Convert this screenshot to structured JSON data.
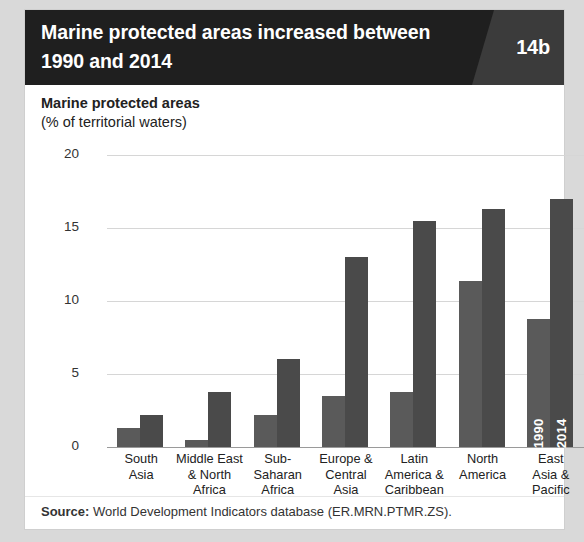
{
  "header": {
    "title": "Marine protected areas increased between 1990 and 2014",
    "badge": "14b"
  },
  "axis_title": {
    "main": "Marine protected areas",
    "sub": "(% of territorial waters)"
  },
  "source": {
    "label": "Source:",
    "text": " World Development Indicators database (ER.MRN.PTMR.ZS)."
  },
  "colors": {
    "header_bg": "#1f1f1f",
    "badge_bg": "#3b3b3b",
    "bar_1990": "#5a5a5a",
    "bar_2014": "#4a4a4a",
    "gridline": "#d6d6d6",
    "page_bg": "#d9d9d9"
  },
  "chart_data": {
    "type": "bar",
    "title": "Marine protected areas increased between 1990 and 2014",
    "xlabel": "",
    "ylabel": "Marine protected areas (% of territorial waters)",
    "ylim": [
      0,
      20
    ],
    "yticks": [
      0,
      5,
      10,
      15,
      20
    ],
    "ytick_labels": [
      "0",
      "5",
      "10",
      "15",
      "20"
    ],
    "grid": true,
    "legend_position": "in-bar (last group)",
    "categories": [
      "South Asia",
      "Middle East & North Africa",
      "Sub-Saharan Africa",
      "Europe & Central Asia",
      "Latin America & Caribbean",
      "North America",
      "East Asia & Pacific"
    ],
    "category_lines": [
      [
        "South",
        "Asia"
      ],
      [
        "Middle East",
        "& North",
        "Africa"
      ],
      [
        "Sub-",
        "Saharan",
        "Africa"
      ],
      [
        "Europe &",
        "Central",
        "Asia"
      ],
      [
        "Latin",
        "America &",
        "Caribbean"
      ],
      [
        "North",
        "America"
      ],
      [
        "East",
        "Asia &",
        "Pacific"
      ]
    ],
    "series": [
      {
        "name": "1990",
        "values": [
          1.3,
          0.5,
          2.2,
          3.5,
          3.8,
          11.4,
          8.8
        ]
      },
      {
        "name": "2014",
        "values": [
          2.2,
          3.8,
          6.0,
          13.0,
          15.5,
          16.3,
          17.0
        ]
      }
    ],
    "annotations": [
      {
        "text": "1990",
        "placement": "inside-bar",
        "group": "East Asia & Pacific",
        "series": "1990"
      },
      {
        "text": "2014",
        "placement": "inside-bar",
        "group": "East Asia & Pacific",
        "series": "2014"
      }
    ]
  }
}
